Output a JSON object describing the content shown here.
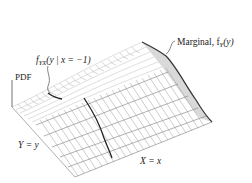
{
  "figure": {
    "type": "3d-wireframe-joint-pdf",
    "labels": {
      "conditional": "f YX(y | x = −1)",
      "conditional_main": "f",
      "conditional_sub": "YX",
      "conditional_rest": "(y | x = −1)",
      "pdf_axis": "PDF",
      "marginal": "Marginal, f",
      "marginal_sub": "Y",
      "marginal_rest": "(y)",
      "y_axis": "Y = y",
      "x_axis": "X = x"
    },
    "colors": {
      "background": "#ffffff",
      "grid": "#9a9a9a",
      "marginal_fill": "#d9d9d9",
      "highlight_line": "#222222",
      "text": "#222222"
    }
  }
}
